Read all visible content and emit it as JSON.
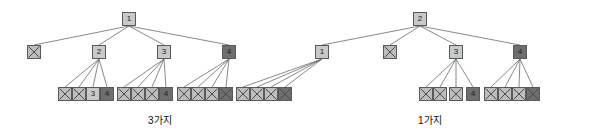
{
  "figure": {
    "title": "",
    "background_color": "#ffffff",
    "node_border_color": "#5a5a5a",
    "edge_color": "#6b6b6b",
    "light_node_color": "#c9c9c9",
    "dark_node_color": "#6e6e6e",
    "captions": [
      {
        "id": "caption-left",
        "text": "3가지",
        "x": 148,
        "y": 112
      },
      {
        "id": "caption-right",
        "text": "1가지",
        "x": 418,
        "y": 112
      }
    ],
    "nodes": [
      {
        "id": "L-root",
        "label": "1",
        "kind": "light",
        "x": 122,
        "y": 12
      },
      {
        "id": "L-a",
        "label": "",
        "kind": "xmark",
        "x": 27,
        "y": 45
      },
      {
        "id": "L-b",
        "label": "2",
        "kind": "light",
        "x": 92,
        "y": 45
      },
      {
        "id": "L-c",
        "label": "3",
        "kind": "light",
        "x": 157,
        "y": 45
      },
      {
        "id": "L-d",
        "label": "4",
        "kind": "dark",
        "x": 222,
        "y": 45
      },
      {
        "id": "L-b1",
        "label": "",
        "kind": "xmark",
        "x": 58,
        "y": 87
      },
      {
        "id": "L-b2",
        "label": "",
        "kind": "xmark",
        "x": 72,
        "y": 87
      },
      {
        "id": "L-b3",
        "label": "3",
        "kind": "light",
        "x": 86,
        "y": 87
      },
      {
        "id": "L-b4",
        "label": "4",
        "kind": "dark",
        "x": 100,
        "y": 87
      },
      {
        "id": "L-c1",
        "label": "",
        "kind": "xmark",
        "x": 117,
        "y": 87
      },
      {
        "id": "L-c2",
        "label": "",
        "kind": "xmark",
        "x": 131,
        "y": 87
      },
      {
        "id": "L-c3",
        "label": "",
        "kind": "xmark",
        "x": 145,
        "y": 87
      },
      {
        "id": "L-c4",
        "label": "4",
        "kind": "dark",
        "x": 159,
        "y": 87
      },
      {
        "id": "L-d1",
        "label": "",
        "kind": "xmark",
        "x": 177,
        "y": 87
      },
      {
        "id": "L-d2",
        "label": "",
        "kind": "xmark",
        "x": 191,
        "y": 87
      },
      {
        "id": "L-d3",
        "label": "",
        "kind": "xmark",
        "x": 205,
        "y": 87
      },
      {
        "id": "L-d4",
        "label": "",
        "kind": "darkx",
        "x": 219,
        "y": 87
      },
      {
        "id": "R-root",
        "label": "2",
        "kind": "light",
        "x": 413,
        "y": 12
      },
      {
        "id": "R-a",
        "label": "1",
        "kind": "light",
        "x": 315,
        "y": 45
      },
      {
        "id": "R-b",
        "label": "",
        "kind": "xmark",
        "x": 383,
        "y": 45
      },
      {
        "id": "R-c",
        "label": "3",
        "kind": "light",
        "x": 449,
        "y": 45
      },
      {
        "id": "R-d",
        "label": "4",
        "kind": "dark",
        "x": 513,
        "y": 45
      },
      {
        "id": "R-a1",
        "label": "",
        "kind": "xmark",
        "x": 236,
        "y": 87
      },
      {
        "id": "R-a2",
        "label": "",
        "kind": "xmark",
        "x": 250,
        "y": 87
      },
      {
        "id": "R-a3",
        "label": "",
        "kind": "xmark",
        "x": 264,
        "y": 87
      },
      {
        "id": "R-a4",
        "label": "",
        "kind": "darkx",
        "x": 278,
        "y": 87
      },
      {
        "id": "R-c1",
        "label": "",
        "kind": "xmark",
        "x": 419,
        "y": 87
      },
      {
        "id": "R-c2",
        "label": "",
        "kind": "xmark",
        "x": 433,
        "y": 87
      },
      {
        "id": "R-c3",
        "label": "",
        "kind": "xmark",
        "x": 449,
        "y": 87
      },
      {
        "id": "R-c4",
        "label": "4",
        "kind": "dark",
        "x": 466,
        "y": 87
      },
      {
        "id": "R-d1",
        "label": "",
        "kind": "xmark",
        "x": 484,
        "y": 87
      },
      {
        "id": "R-d2",
        "label": "",
        "kind": "xmark",
        "x": 498,
        "y": 87
      },
      {
        "id": "R-d3",
        "label": "",
        "kind": "xmark",
        "x": 512,
        "y": 87
      },
      {
        "id": "R-d4",
        "label": "",
        "kind": "darkx",
        "x": 526,
        "y": 87
      }
    ],
    "edges": [
      {
        "from": "L-root",
        "to": "L-a"
      },
      {
        "from": "L-root",
        "to": "L-b"
      },
      {
        "from": "L-root",
        "to": "L-c"
      },
      {
        "from": "L-root",
        "to": "L-d"
      },
      {
        "from": "L-b",
        "to": "L-b1"
      },
      {
        "from": "L-b",
        "to": "L-b2"
      },
      {
        "from": "L-b",
        "to": "L-b3"
      },
      {
        "from": "L-b",
        "to": "L-b4"
      },
      {
        "from": "L-c",
        "to": "L-c1"
      },
      {
        "from": "L-c",
        "to": "L-c2"
      },
      {
        "from": "L-c",
        "to": "L-c3"
      },
      {
        "from": "L-c",
        "to": "L-c4"
      },
      {
        "from": "L-d",
        "to": "L-d1"
      },
      {
        "from": "L-d",
        "to": "L-d2"
      },
      {
        "from": "L-d",
        "to": "L-d3"
      },
      {
        "from": "L-d",
        "to": "L-d4"
      },
      {
        "from": "R-root",
        "to": "R-a"
      },
      {
        "from": "R-root",
        "to": "R-b"
      },
      {
        "from": "R-root",
        "to": "R-c"
      },
      {
        "from": "R-root",
        "to": "R-d"
      },
      {
        "from": "R-a",
        "to": "R-a1"
      },
      {
        "from": "R-a",
        "to": "R-a2"
      },
      {
        "from": "R-a",
        "to": "R-a3"
      },
      {
        "from": "R-a",
        "to": "R-a4"
      },
      {
        "from": "R-c",
        "to": "R-c1"
      },
      {
        "from": "R-c",
        "to": "R-c2"
      },
      {
        "from": "R-c",
        "to": "R-c3"
      },
      {
        "from": "R-c",
        "to": "R-c4"
      },
      {
        "from": "R-d",
        "to": "R-d1"
      },
      {
        "from": "R-d",
        "to": "R-d2"
      },
      {
        "from": "R-d",
        "to": "R-d3"
      },
      {
        "from": "R-d",
        "to": "R-d4"
      }
    ]
  }
}
